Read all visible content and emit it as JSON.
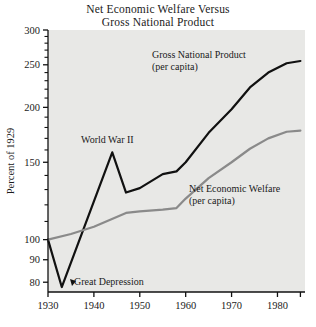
{
  "chart_data": {
    "type": "line",
    "title": "Net Economic Welfare Versus Gross National Product",
    "title_lines": [
      "Net Economic Welfare Versus",
      "Gross National Product"
    ],
    "xlabel": "",
    "ylabel": "Percent of 1929",
    "yscale": "log",
    "ylim": [
      76,
      300
    ],
    "xlim": [
      1930,
      1986
    ],
    "grid": false,
    "legend_position": "inline-annotations",
    "yticks": [
      80,
      90,
      100,
      150,
      200,
      250,
      300
    ],
    "ytick_labels": [
      "80",
      "90",
      "100",
      "150",
      "200",
      "250",
      "300"
    ],
    "yminor_ticks": [
      110,
      120,
      130,
      140,
      160,
      170,
      180,
      190,
      210,
      220,
      230,
      240,
      260,
      270,
      280,
      290
    ],
    "xticks": [
      1930,
      1940,
      1950,
      1960,
      1970,
      1980,
      1985
    ],
    "xtick_labels": [
      "1930",
      "1940",
      "1950",
      "1960",
      "1970",
      "1980",
      ""
    ],
    "series": [
      {
        "name": "Gross National Product (per capita)",
        "color": "#111111",
        "width": 2.2,
        "x": [
          1930,
          1933,
          1944,
          1947,
          1950,
          1955,
          1958,
          1960,
          1965,
          1970,
          1974,
          1978,
          1982,
          1985
        ],
        "values": [
          100,
          78,
          158,
          128,
          131,
          141,
          143,
          150,
          175,
          198,
          222,
          240,
          252,
          255
        ]
      },
      {
        "name": "Net Economic Welfare (per capita)",
        "color": "#8a8a8a",
        "width": 2.2,
        "x": [
          1930,
          1935,
          1940,
          1947,
          1950,
          1955,
          1958,
          1960,
          1965,
          1970,
          1974,
          1978,
          1982,
          1985
        ],
        "values": [
          100,
          103,
          107,
          115,
          116,
          117,
          118,
          124,
          138,
          150,
          161,
          170,
          176,
          177
        ]
      }
    ],
    "annotations": [
      {
        "name": "gnp-label",
        "lines": [
          "Gross National Product",
          "(per capita)"
        ],
        "x": 152,
        "y": 58,
        "align": "start"
      },
      {
        "name": "new-label",
        "lines": [
          "Net Economic Welfare",
          "(per capita)",
          ""
        ],
        "x": 189,
        "y": 192,
        "align": "start"
      },
      {
        "name": "world-war-2-label",
        "lines": [
          "World War II"
        ],
        "x": 81,
        "y": 143,
        "align": "start"
      },
      {
        "name": "great-depression-label",
        "lines": [
          "Great Depression"
        ],
        "x": 74,
        "y": 285,
        "align": "start"
      }
    ]
  }
}
